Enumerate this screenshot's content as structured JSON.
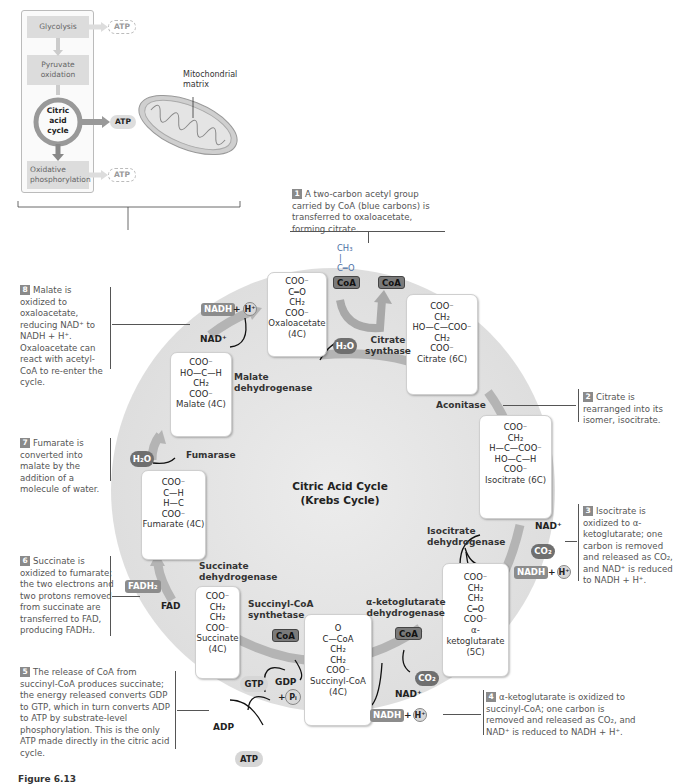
{
  "overview": {
    "steps": [
      {
        "label": "Glycolysis",
        "atp": "ATP"
      },
      {
        "label": "Pyruvate oxidation"
      },
      {
        "label": "Citric acid cycle",
        "atp": "ATP"
      },
      {
        "label": "Oxidative phosphorylation",
        "atp": "ATP"
      }
    ],
    "mitochondria_label": "Mitochondrial matrix"
  },
  "cycle": {
    "title_line1": "Citric Acid Cycle",
    "title_line2": "(Krebs Cycle)"
  },
  "molecules": {
    "oxaloacetate": {
      "rows": [
        "COO⁻",
        "|",
        "C═O",
        "|",
        "CH₂",
        "|",
        "COO⁻"
      ],
      "name": "Oxaloacetate",
      "carbons": "(4C)"
    },
    "citrate": {
      "rows": [
        "COO⁻",
        "|",
        "CH₂",
        "|",
        "HO—C—COO⁻",
        "|",
        "CH₂",
        "|",
        "COO⁻"
      ],
      "name": "Citrate (6C)"
    },
    "isocitrate": {
      "rows": [
        "COO⁻",
        "|",
        "CH₂",
        "|",
        "H—C—COO⁻",
        "|",
        "HO—C—H",
        "|",
        "COO⁻"
      ],
      "name": "Isocitrate (6C)"
    },
    "alpha_ketoglutarate": {
      "rows": [
        "COO⁻",
        "|",
        "CH₂",
        "|",
        "CH₂",
        "|",
        "C═O",
        "|",
        "COO⁻"
      ],
      "name": "α-ketoglutarate",
      "carbons": "(5C)"
    },
    "succinyl_coa": {
      "rows": [
        "O",
        "‖",
        "C—CoA",
        "|",
        "CH₂",
        "|",
        "CH₂",
        "|",
        "COO⁻"
      ],
      "name": "Succinyl-CoA",
      "carbons": "(4C)"
    },
    "succinate": {
      "rows": [
        "COO⁻",
        "|",
        "CH₂",
        "|",
        "CH₂",
        "|",
        "COO⁻"
      ],
      "name": "Succinate",
      "carbons": "(4C)"
    },
    "fumarate": {
      "rows": [
        "COO⁻",
        "|",
        "C—H",
        "‖",
        "H—C",
        "|",
        "COO⁻"
      ],
      "name": "Fumarate (4C)"
    },
    "malate": {
      "rows": [
        "COO⁻",
        "|",
        "HO—C—H",
        "|",
        "CH₂",
        "|",
        "COO⁻"
      ],
      "name": "Malate (4C)"
    },
    "acetyl": {
      "rows": [
        "CH₃",
        "|",
        "C═O"
      ],
      "coa": "CoA"
    }
  },
  "enzymes": {
    "citrate_synthase": [
      "Citrate",
      "synthase"
    ],
    "aconitase": "Aconitase",
    "isocitrate_dehydrogenase": [
      "Isocitrate",
      "dehydrogenase"
    ],
    "akg_dehydrogenase": [
      "α-ketoglutarate",
      "dehydrogenase"
    ],
    "succinyl_coa_synthetase": [
      "Succinyl-CoA",
      "synthetase"
    ],
    "succinate_dehydrogenase": [
      "Succinate",
      "dehydrogenase"
    ],
    "fumarase": "Fumarase",
    "malate_dehydrogenase": [
      "Malate",
      "dehydrogenase"
    ]
  },
  "cofactors": {
    "coa": "CoA",
    "h2o": "H₂O",
    "nad": "NAD⁺",
    "nadh": "NADH",
    "plus": "+",
    "h": "H⁺",
    "co2": "CO₂",
    "fad": "FAD",
    "fadh2": "FADH₂",
    "gtp": "GTP",
    "gdp": "GDP",
    "pi": "Pᵢ",
    "adp": "ADP",
    "atp": "ATP"
  },
  "notes": [
    {
      "num": "1",
      "text": "A two-carbon acetyl group carried by CoA (blue carbons) is transferred to oxaloacetate, forming citrate."
    },
    {
      "num": "2",
      "text": "Citrate is rearranged into its isomer, isocitrate."
    },
    {
      "num": "3",
      "text": "Isocitrate is oxidized to α-ketoglutarate; one carbon is removed and released as CO₂, and NAD⁺ is reduced to NADH + H⁺."
    },
    {
      "num": "4",
      "text": "α-ketoglutarate is oxidized to succinyl-CoA; one carbon is removed and released as CO₂, and NAD⁺ is reduced to NADH + H⁺."
    },
    {
      "num": "5",
      "text": "The release of CoA from succinyl-CoA produces succinate; the energy released converts GDP to GTP, which in turn converts ADP to ATP by substrate-level phosphorylation. This is the only ATP made directly in the citric acid cycle."
    },
    {
      "num": "6",
      "text": "Succinate is oxidized to fumarate; the two electrons and two protons removed from succinate are transferred to FAD, producing FADH₂."
    },
    {
      "num": "7",
      "text": "Fumarate is converted into malate by the addition of a molecule of water."
    },
    {
      "num": "8",
      "text": "Malate is oxidized to oxaloacetate, reducing NAD⁺ to NADH + H⁺. Oxaloacetate can react with acetyl-CoA to re-enter the cycle."
    }
  ],
  "figure_label": "Figure 6.13"
}
